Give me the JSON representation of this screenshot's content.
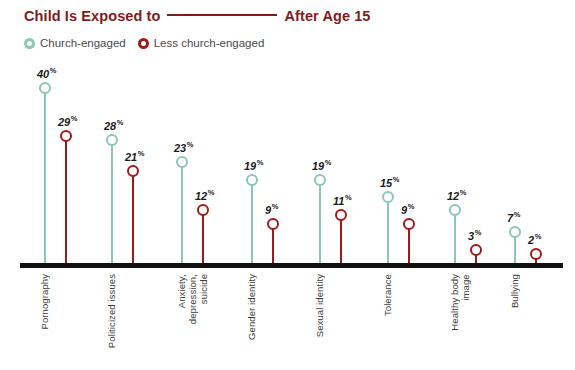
{
  "header": {
    "title_part1": "Child Is Exposed to",
    "title_blank": "blank-line-placeholder",
    "title_part2": "After Age 15",
    "title_color": "#7E1C1C"
  },
  "legend": {
    "position": "top-left",
    "items": [
      {
        "label": "Church-engaged",
        "color": "#8CC7B0",
        "marker": "open-circle-teal-icon"
      },
      {
        "label": "Less church-engaged",
        "color": "#9B1B1B",
        "marker": "open-circle-red-icon"
      }
    ]
  },
  "axis": {
    "baseline_color": "#111111",
    "percent_suffix": "%"
  },
  "chart_data": {
    "type": "line",
    "subtitle": "",
    "xlabel": "",
    "ylabel": "",
    "ylim": [
      0,
      44
    ],
    "grid": false,
    "legend_position": "top-left",
    "categories": [
      "Pornography",
      "Politicized issues",
      "Anxiety,\ndepression,\nsuicide",
      "Gender identity",
      "Sexual identity",
      "Tolerance",
      "Healthy body\nimage",
      "Bullying"
    ],
    "series": [
      {
        "name": "Church-engaged",
        "color": "#8CC7B0",
        "values": [
          40,
          28,
          23,
          19,
          19,
          15,
          12,
          7
        ],
        "labels": [
          "40%",
          "28%",
          "23%",
          "19%",
          "19%",
          "15%",
          "12%",
          "7%"
        ]
      },
      {
        "name": "Less church-engaged",
        "color": "#9B1B1B",
        "values": [
          29,
          21,
          12,
          9,
          11,
          9,
          3,
          2
        ],
        "labels": [
          "29%",
          "21%",
          "12%",
          "9%",
          "11%",
          "9%",
          "3%",
          "2%"
        ]
      }
    ]
  },
  "geometry": {
    "baseline_y": 263,
    "px_per_unit": 4.38,
    "group_x": [
      45,
      112,
      182,
      252,
      320,
      388,
      455,
      515
    ],
    "pair_offset": 21
  }
}
